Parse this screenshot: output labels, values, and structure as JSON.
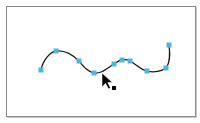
{
  "diagram": {
    "type": "bezier-path-with-anchor-points",
    "frame": {
      "x": 6,
      "y": 6,
      "width": 188,
      "height": 109,
      "border_color": "#8a8a8a"
    },
    "path": {
      "stroke_color": "#1a1a1a",
      "stroke_width": 1.3,
      "d": "M41,70 C43,60 50,52 56,51 C66,50 74,56 79,61 C84,67 88,72 94,73 C101,74 106,69 114,64 C117,62 119,60 122,60 C126,59 128,60 130,61 C136,64 141,70 147,71 C154,73 162,71 166,68 C170,63 170,52 169,45"
    },
    "anchor_points": {
      "color": "#4fb6e3",
      "size": 5,
      "points": [
        {
          "x": 41,
          "y": 70
        },
        {
          "x": 56,
          "y": 51
        },
        {
          "x": 79,
          "y": 61
        },
        {
          "x": 94,
          "y": 73
        },
        {
          "x": 114,
          "y": 64
        },
        {
          "x": 122,
          "y": 60
        },
        {
          "x": 130,
          "y": 61
        },
        {
          "x": 147,
          "y": 71
        },
        {
          "x": 166,
          "y": 68
        },
        {
          "x": 169,
          "y": 45
        }
      ]
    },
    "cursor": {
      "icon": "direct-selection-arrow-icon",
      "tip_x": 102,
      "tip_y": 73,
      "color": "#000000",
      "badge": {
        "icon": "filled-square-icon",
        "x": 112,
        "y": 86,
        "size": 4
      }
    }
  }
}
